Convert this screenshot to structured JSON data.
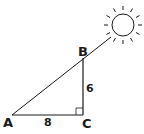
{
  "diagram": {
    "vertices": [
      {
        "id": "A",
        "label": "A"
      },
      {
        "id": "B",
        "label": "B"
      },
      {
        "id": "C",
        "label": "C"
      }
    ],
    "sides": [
      {
        "between": [
          "A",
          "C"
        ],
        "length_label": "8"
      },
      {
        "between": [
          "C",
          "B"
        ],
        "length_label": "6"
      }
    ],
    "right_angle_at": "C",
    "sun": {
      "name": "sun",
      "ray_count": 12
    },
    "colors": {
      "stroke": "#1a1a1a",
      "background": "#ffffff"
    }
  }
}
